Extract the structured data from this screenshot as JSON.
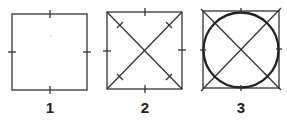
{
  "figures": [
    {
      "id": "1",
      "label": "1",
      "description": "Square with midpoint tick marks on each side",
      "x": 12,
      "y": 14,
      "size": 75,
      "diagonals": false,
      "circle": false
    },
    {
      "id": "2",
      "label": "2",
      "description": "Square with midpoint ticks and both diagonals with tick marks",
      "x": 107,
      "y": 12,
      "size": 75,
      "diagonals": true,
      "circle": false
    },
    {
      "id": "3",
      "label": "3",
      "description": "Square with diagonals and inscribed circle",
      "x": 203,
      "y": 11,
      "size": 76,
      "diagonals": true,
      "circle": true
    }
  ],
  "colors": {
    "stroke": "#333333",
    "background": "#ffffff",
    "label": "#222222"
  }
}
